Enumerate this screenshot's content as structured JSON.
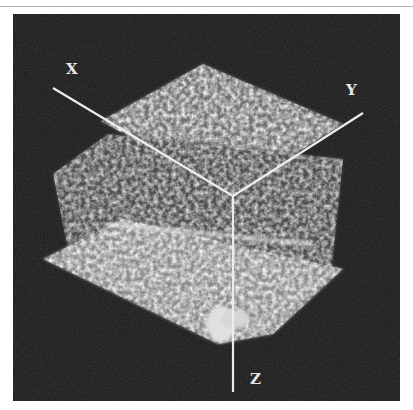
{
  "figure": {
    "axes": {
      "x_label": "X",
      "y_label": "Y",
      "z_label": "Z"
    },
    "colors": {
      "background": "#161616",
      "axis_line": "#e8e8e8",
      "volume_light": "#d8d8d8",
      "volume_mid": "#8a8a8a"
    }
  }
}
